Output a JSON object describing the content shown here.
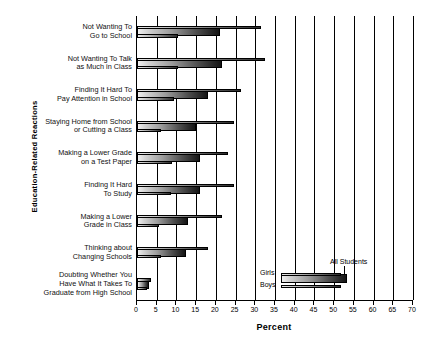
{
  "chart_data": {
    "type": "bar",
    "orientation": "horizontal",
    "title": "",
    "xlabel": "Percent",
    "ylabel": "Education-Related Reactions",
    "xlim": [
      0,
      70
    ],
    "xticks": [
      0,
      5,
      10,
      15,
      20,
      25,
      30,
      35,
      40,
      45,
      50,
      55,
      60,
      65,
      70
    ],
    "xticklabels": [
      "0",
      "5",
      "10",
      "15",
      "20",
      "25",
      "30",
      "35",
      "40",
      "45",
      "50",
      "55",
      "60",
      "65",
      "70"
    ],
    "grid": true,
    "grid_axis": "x",
    "legend_position": "lower-right-inset",
    "categories": [
      "Not Wanting To Go to School",
      "Not Wanting To Talk as Much in Class",
      "Finding It Hard To Pay Attention in School",
      "Staying Home from School or Cutting a Class",
      "Making a Lower Grade on a Test Paper",
      "Finding It Hard To Study",
      "Making a Lower Grade in Class",
      "Thinking about Changing Schools",
      "Doubting Whether You Have What It Takes To Graduate from High School"
    ],
    "category_lines": [
      [
        "Not Wanting To",
        "Go to School"
      ],
      [
        "Not Wanting To Talk",
        "as Much in Class"
      ],
      [
        "Finding It Hard To",
        "Pay Attention in School"
      ],
      [
        "Staying Home from School",
        "or Cutting a Class"
      ],
      [
        "Making a Lower Grade",
        "on a Test Paper"
      ],
      [
        "Finding It Hard",
        "To Study"
      ],
      [
        "Making a Lower",
        "Grade in Class"
      ],
      [
        "Thinking about",
        "Changing Schools"
      ],
      [
        "Doubting Whether You",
        "Have What It Takes To",
        "Graduate from High School"
      ]
    ],
    "series": [
      {
        "name": "Girls",
        "values": [
          31.5,
          32.5,
          26.5,
          24.5,
          23.0,
          24.5,
          21.5,
          18.0,
          3.5
        ]
      },
      {
        "name": "All Students",
        "values": [
          21.0,
          21.5,
          18.0,
          15.0,
          16.0,
          16.0,
          13.0,
          12.5,
          3.0
        ]
      },
      {
        "name": "Boys",
        "values": [
          10.5,
          10.5,
          9.5,
          6.0,
          9.0,
          8.5,
          5.5,
          6.0,
          2.5
        ]
      }
    ]
  },
  "axis": {
    "x_title": "Percent",
    "y_title": "Education-Related Reactions"
  },
  "legend": {
    "girls_label": "Girls",
    "boys_label": "Boys",
    "all_students_label": "All Students"
  }
}
